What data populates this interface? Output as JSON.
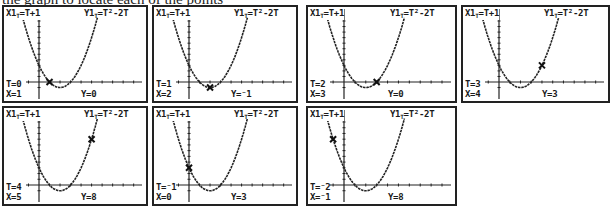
{
  "caption": "the graph to locate each of the points",
  "equations": {
    "x": "X1T=T+1",
    "y": "Y1T=T²-2T"
  },
  "screens": [
    {
      "T": "T=0",
      "X": "X=1",
      "Y": "Y=0",
      "t": 0
    },
    {
      "T": "T=1",
      "X": "X=2",
      "Y": "Y=⁻1",
      "t": 1
    },
    {
      "T": "T=2",
      "X": "X=3",
      "Y": "Y=0",
      "t": 2
    },
    {
      "T": "T=3",
      "X": "X=4",
      "Y": "Y=3",
      "t": 3
    },
    {
      "T": "T=4",
      "X": "X=5",
      "Y": "Y=8",
      "t": 4
    },
    {
      "T": "T=⁻1",
      "X": "X=0",
      "Y": "Y=3",
      "t": -1
    },
    {
      "T": "T=⁻2",
      "X": "X=⁻1",
      "Y": "Y=8",
      "t": -2
    }
  ],
  "window": {
    "xmin": -2,
    "xmax": 9,
    "ymin": -2,
    "ymax": 12
  }
}
